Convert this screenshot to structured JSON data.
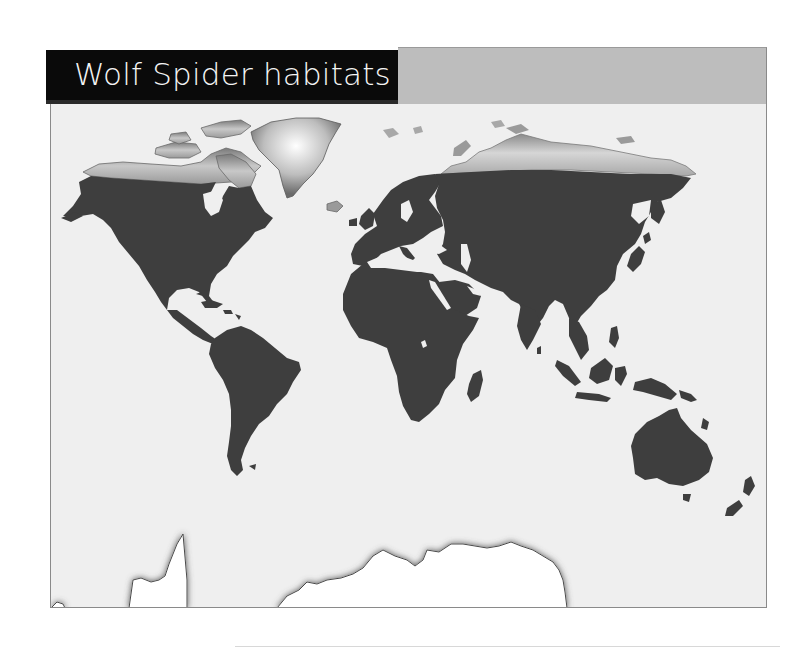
{
  "title": "Wolf Spider habitats",
  "colors": {
    "title_bar": "#0a0a0a",
    "title_text": "#f4f4f4",
    "header_fill": "#bdbdbd",
    "ocean": "#efefef",
    "habitat_land": "#3e3e3e",
    "non_habitat_land": "#ffffff",
    "frame_border": "#8a8a8a"
  },
  "map": {
    "projection": "world",
    "habitat_regions": [
      "North America",
      "Central America",
      "Caribbean",
      "South America",
      "Europe",
      "Africa",
      "Madagascar",
      "Middle East",
      "Asia",
      "Japan",
      "Southeast Asia",
      "Indonesia",
      "Papua New Guinea",
      "Australia",
      "Tasmania",
      "New Zealand"
    ],
    "non_habitat_regions": [
      "Arctic Canada",
      "Greenland",
      "Svalbard",
      "Northern Siberia",
      "Antarctica"
    ]
  }
}
